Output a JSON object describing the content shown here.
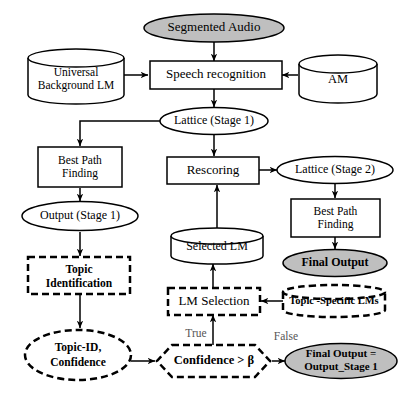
{
  "diagram": {
    "colors": {
      "stroke": "#000000",
      "fill_white": "#ffffff",
      "fill_gray": "#bfbfbf",
      "text": "#000000",
      "edge_label": "#555555"
    },
    "nodes": {
      "segmented_audio": {
        "label": "Segmented Audio",
        "shape": "ellipse",
        "style": "solid",
        "fill": "gray"
      },
      "universal_background_lm": {
        "label_line1": "Universal",
        "label_line2": "Background LM",
        "shape": "cylinder",
        "style": "solid",
        "fill": "white"
      },
      "speech_recognition": {
        "label": "Speech recognition",
        "shape": "rect",
        "style": "solid",
        "fill": "white"
      },
      "am": {
        "label": "AM",
        "shape": "cylinder",
        "style": "solid",
        "fill": "white"
      },
      "lattice_stage1": {
        "label": "Lattice (Stage 1)",
        "shape": "ellipse",
        "style": "solid",
        "fill": "white"
      },
      "best_path_finding_left": {
        "label_line1": "Best Path",
        "label_line2": "Finding",
        "shape": "rect",
        "style": "solid",
        "fill": "white"
      },
      "rescoring": {
        "label": "Rescoring",
        "shape": "rect",
        "style": "solid",
        "fill": "white"
      },
      "lattice_stage2": {
        "label": "Lattice (Stage 2)",
        "shape": "ellipse",
        "style": "solid",
        "fill": "white"
      },
      "output_stage1": {
        "label": "Output (Stage 1)",
        "shape": "ellipse",
        "style": "solid",
        "fill": "white"
      },
      "best_path_finding_right": {
        "label_line1": "Best Path",
        "label_line2": "Finding",
        "shape": "rect",
        "style": "solid",
        "fill": "white"
      },
      "selected_lm": {
        "label": "Selected LM",
        "shape": "cylinder",
        "style": "solid",
        "fill": "white"
      },
      "final_output": {
        "label": "Final Output",
        "shape": "ellipse",
        "style": "solid",
        "fill": "gray"
      },
      "topic_identification": {
        "label_line1": "Topic",
        "label_line2": "Identification",
        "shape": "rect",
        "style": "dashed",
        "fill": "white"
      },
      "lm_selection": {
        "label": "LM Selection",
        "shape": "rect",
        "style": "dashed",
        "fill": "white"
      },
      "topic_specific_lms": {
        "label": "Topic -Specific LMs",
        "shape": "cylinder",
        "style": "dashed",
        "fill": "white"
      },
      "topic_id_confidence": {
        "label_line1": "Topic-ID,",
        "label_line2": "Confidence",
        "shape": "ellipse",
        "style": "dashed",
        "fill": "white"
      },
      "confidence_threshold": {
        "label": "Confidence > β",
        "shape": "hexagon",
        "style": "dashed",
        "fill": "white"
      },
      "final_output_stage1": {
        "label_line1": "Final Output =",
        "label_line2": "Output_Stage 1",
        "shape": "ellipse",
        "style": "solid",
        "fill": "gray"
      }
    },
    "edge_labels": {
      "true_branch": "True",
      "false_branch": "False"
    }
  }
}
